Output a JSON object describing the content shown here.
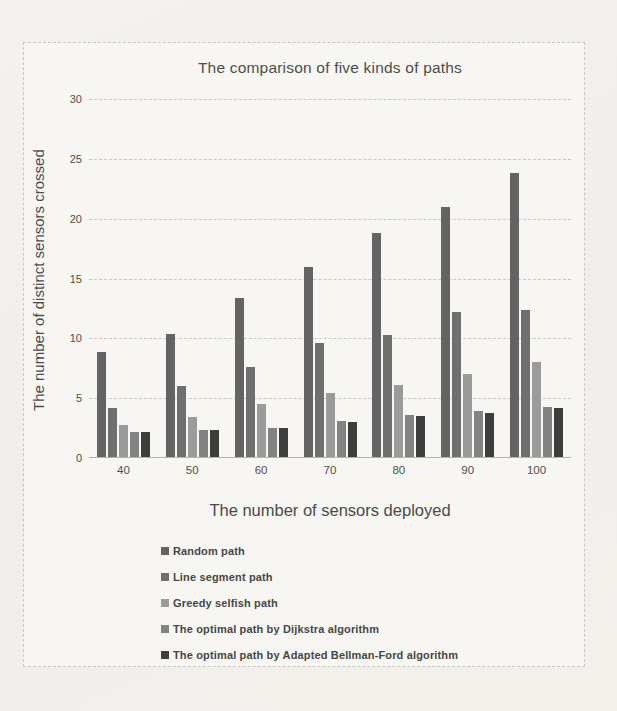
{
  "chart_data": {
    "type": "bar",
    "title": "The comparison of five kinds of paths",
    "xlabel": "The number of sensors deployed",
    "ylabel": "The number of distinct sensors crossed",
    "categories": [
      "40",
      "50",
      "60",
      "70",
      "80",
      "90",
      "100"
    ],
    "series": [
      {
        "name": "Random path",
        "color": "#646464",
        "values": [
          8.9,
          10.4,
          13.4,
          16.0,
          18.8,
          21.0,
          23.8
        ]
      },
      {
        "name": "Line segment  path",
        "color": "#6f6f6f",
        "values": [
          4.2,
          6.0,
          7.6,
          9.6,
          10.3,
          12.2,
          12.4
        ]
      },
      {
        "name": "Greedy selfish path",
        "color": "#9b9b9b",
        "values": [
          2.8,
          3.4,
          4.5,
          5.4,
          6.1,
          7.0,
          8.0
        ]
      },
      {
        "name": "The optimal path by Dijkstra algorithm",
        "color": "#828282",
        "values": [
          2.2,
          2.3,
          2.5,
          3.1,
          3.6,
          3.9,
          4.3
        ]
      },
      {
        "name": "The optimal path by Adapted Bellman-Ford algorithm",
        "color": "#3e3e3e",
        "values": [
          2.2,
          2.3,
          2.5,
          3.0,
          3.5,
          3.8,
          4.2
        ]
      }
    ],
    "ylim": [
      0,
      30
    ],
    "ytick_step": 5,
    "yticks": [
      "0",
      "5",
      "10",
      "15",
      "20",
      "25",
      "30"
    ],
    "grid": true,
    "legend_position": "bottom-left"
  }
}
